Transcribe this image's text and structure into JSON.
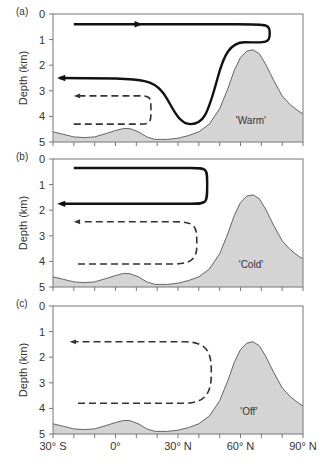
{
  "chart_data": {
    "type": "line",
    "title": "",
    "xlabel": "",
    "ylabel": "Depth (km)",
    "xlim": [
      -30,
      90
    ],
    "ylim": [
      5,
      0
    ],
    "x_ticks": [
      {
        "value": -30,
        "label": "30° S"
      },
      {
        "value": 0,
        "label": "0°"
      },
      {
        "value": 30,
        "label": "30° N"
      },
      {
        "value": 60,
        "label": "60° N"
      },
      {
        "value": 90,
        "label": "90° N"
      }
    ],
    "x_minor_tick_step": 10,
    "y_ticks": [
      0,
      1,
      2,
      3,
      4,
      5
    ],
    "grid": false,
    "colors": {
      "seafloor_fill": "#d4d4d4",
      "seafloor_line": "#555555",
      "frame": "#777777",
      "flow": "#111111",
      "dashed_flow": "#333333"
    },
    "seafloor_profile": [
      [
        -30,
        4.6
      ],
      [
        -25,
        4.7
      ],
      [
        -20,
        4.8
      ],
      [
        -15,
        4.83
      ],
      [
        -10,
        4.8
      ],
      [
        -5,
        4.68
      ],
      [
        0,
        4.55
      ],
      [
        4,
        4.47
      ],
      [
        7,
        4.48
      ],
      [
        11,
        4.6
      ],
      [
        15,
        4.8
      ],
      [
        19,
        4.9
      ],
      [
        25,
        4.9
      ],
      [
        30,
        4.85
      ],
      [
        35,
        4.75
      ],
      [
        40,
        4.6
      ],
      [
        45,
        4.3
      ],
      [
        50,
        3.7
      ],
      [
        54,
        2.9
      ],
      [
        57,
        2.2
      ],
      [
        60,
        1.7
      ],
      [
        63,
        1.45
      ],
      [
        66,
        1.4
      ],
      [
        69,
        1.55
      ],
      [
        72,
        1.95
      ],
      [
        76,
        2.6
      ],
      [
        80,
        3.2
      ],
      [
        84,
        3.55
      ],
      [
        88,
        3.8
      ],
      [
        90,
        3.9
      ]
    ],
    "panels": [
      {
        "id": "a",
        "label": "(a)",
        "mode": "'Warm'",
        "mode_label_pos": [
          65,
          4.3
        ],
        "solid_path": [
          [
            "M",
            -20,
            0.4
          ],
          [
            "L",
            58,
            0.4
          ],
          [
            "C",
            74,
            0.4,
            74,
            0.4,
            74,
            0.8
          ],
          [
            "C",
            74,
            1.2,
            70,
            1.1,
            62,
            1.1
          ],
          [
            "C",
            55,
            1.1,
            52,
            1.6,
            49,
            2.5
          ],
          [
            "C",
            44,
            4.0,
            42,
            4.3,
            36,
            4.3
          ],
          [
            "C",
            29,
            4.3,
            26,
            3.3,
            22,
            3.0
          ],
          [
            "C",
            18,
            2.6,
            12,
            2.55,
            0,
            2.52
          ],
          [
            "L",
            -27,
            2.5
          ]
        ],
        "solid_arrows": [
          {
            "x": 13,
            "y": 0.4,
            "dir": "right"
          },
          {
            "x": -28,
            "y": 2.5,
            "dir": "left"
          }
        ],
        "dashed_path": [
          [
            "M",
            -20,
            4.3
          ],
          [
            "L",
            10,
            4.3
          ],
          [
            "C",
            17,
            4.3,
            17,
            4.3,
            17,
            3.75
          ],
          [
            "C",
            17,
            3.2,
            17,
            3.2,
            10,
            3.2
          ],
          [
            "L",
            -18,
            3.2
          ]
        ],
        "dashed_arrows": [
          {
            "x": -20,
            "y": 3.2,
            "dir": "left"
          }
        ]
      },
      {
        "id": "b",
        "label": "(b)",
        "mode": "'Cold'",
        "mode_label_pos": [
          65,
          4.25
        ],
        "solid_path": [
          [
            "M",
            -20,
            0.35
          ],
          [
            "L",
            36,
            0.35
          ],
          [
            "C",
            44,
            0.35,
            44,
            0.35,
            44,
            1.0
          ],
          [
            "C",
            44,
            1.75,
            44,
            1.75,
            36,
            1.75
          ],
          [
            "L",
            -26,
            1.75
          ]
        ],
        "solid_arrows": [
          {
            "x": -28,
            "y": 1.75,
            "dir": "left"
          }
        ],
        "dashed_path": [
          [
            "M",
            -18,
            4.1
          ],
          [
            "L",
            28,
            4.1
          ],
          [
            "C",
            40,
            4.1,
            39,
            3.6,
            39,
            3.2
          ],
          [
            "C",
            39,
            2.6,
            38,
            2.45,
            28,
            2.45
          ],
          [
            "L",
            -16,
            2.45
          ]
        ],
        "dashed_arrows": [
          {
            "x": -20,
            "y": 2.45,
            "dir": "left"
          }
        ]
      },
      {
        "id": "c",
        "label": "(c)",
        "mode": "'Off'",
        "mode_label_pos": [
          64,
          4.25
        ],
        "solid_path": [],
        "solid_arrows": [],
        "dashed_path": [
          [
            "M",
            -18,
            3.8
          ],
          [
            "L",
            33,
            3.8
          ],
          [
            "C",
            45,
            3.8,
            46,
            3.2,
            46,
            2.6
          ],
          [
            "C",
            46,
            1.9,
            45,
            1.4,
            33,
            1.4
          ],
          [
            "L",
            -20,
            1.4
          ]
        ],
        "dashed_arrows": [
          {
            "x": -22,
            "y": 1.4,
            "dir": "left"
          }
        ]
      }
    ]
  }
}
